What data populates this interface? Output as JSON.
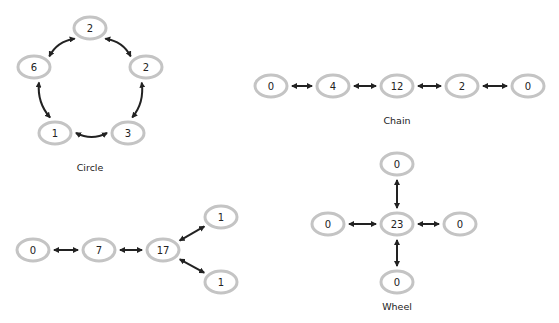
{
  "diagrams": {
    "circle": {
      "caption": "Circle",
      "nodes": [
        {
          "id": "c_top",
          "label": "2",
          "x": 90,
          "y": 28
        },
        {
          "id": "c_right",
          "label": "2",
          "x": 146,
          "y": 67
        },
        {
          "id": "c_bottom_right",
          "label": "3",
          "x": 128,
          "y": 133
        },
        {
          "id": "c_bottom_left",
          "label": "1",
          "x": 55,
          "y": 133
        },
        {
          "id": "c_left",
          "label": "6",
          "x": 34,
          "y": 67
        }
      ],
      "edges": [
        [
          "c_top",
          "c_right"
        ],
        [
          "c_right",
          "c_bottom_right"
        ],
        [
          "c_bottom_right",
          "c_bottom_left"
        ],
        [
          "c_bottom_left",
          "c_left"
        ],
        [
          "c_left",
          "c_top"
        ]
      ]
    },
    "chain": {
      "caption": "Chain",
      "nodes": [
        {
          "id": "ch1",
          "label": "0",
          "x": 271,
          "y": 86
        },
        {
          "id": "ch2",
          "label": "4",
          "x": 333,
          "y": 86
        },
        {
          "id": "ch3",
          "label": "12",
          "x": 397,
          "y": 86
        },
        {
          "id": "ch4",
          "label": "2",
          "x": 462,
          "y": 86
        },
        {
          "id": "ch5",
          "label": "0",
          "x": 528,
          "y": 86
        }
      ],
      "edges": [
        [
          "ch1",
          "ch2"
        ],
        [
          "ch2",
          "ch3"
        ],
        [
          "ch3",
          "ch4"
        ],
        [
          "ch4",
          "ch5"
        ]
      ]
    },
    "y_shape": {
      "caption": "",
      "nodes": [
        {
          "id": "y1",
          "label": "0",
          "x": 33,
          "y": 250
        },
        {
          "id": "y2",
          "label": "7",
          "x": 99,
          "y": 250
        },
        {
          "id": "y3",
          "label": "17",
          "x": 163,
          "y": 250
        },
        {
          "id": "y4",
          "label": "1",
          "x": 221,
          "y": 217
        },
        {
          "id": "y5",
          "label": "1",
          "x": 221,
          "y": 282
        }
      ],
      "edges": [
        [
          "y1",
          "y2"
        ],
        [
          "y2",
          "y3"
        ],
        [
          "y3",
          "y4"
        ],
        [
          "y3",
          "y5"
        ]
      ]
    },
    "wheel": {
      "caption": "Wheel",
      "nodes": [
        {
          "id": "w_center",
          "label": "23",
          "x": 397,
          "y": 224
        },
        {
          "id": "w_top",
          "label": "0",
          "x": 397,
          "y": 164
        },
        {
          "id": "w_left",
          "label": "0",
          "x": 328,
          "y": 224
        },
        {
          "id": "w_right",
          "label": "0",
          "x": 460,
          "y": 224
        },
        {
          "id": "w_bottom",
          "label": "0",
          "x": 397,
          "y": 282
        }
      ],
      "edges": [
        [
          "w_center",
          "w_top"
        ],
        [
          "w_center",
          "w_left"
        ],
        [
          "w_center",
          "w_right"
        ],
        [
          "w_center",
          "w_bottom"
        ]
      ]
    }
  },
  "captions": {
    "circle": {
      "text": "Circle",
      "x": 90,
      "y": 171
    },
    "chain": {
      "text": "Chain",
      "x": 397,
      "y": 124
    },
    "wheel": {
      "text": "Wheel",
      "x": 397,
      "y": 310
    }
  },
  "style": {
    "node_stroke": "#c4c4c4",
    "edge_color": "#222222"
  }
}
